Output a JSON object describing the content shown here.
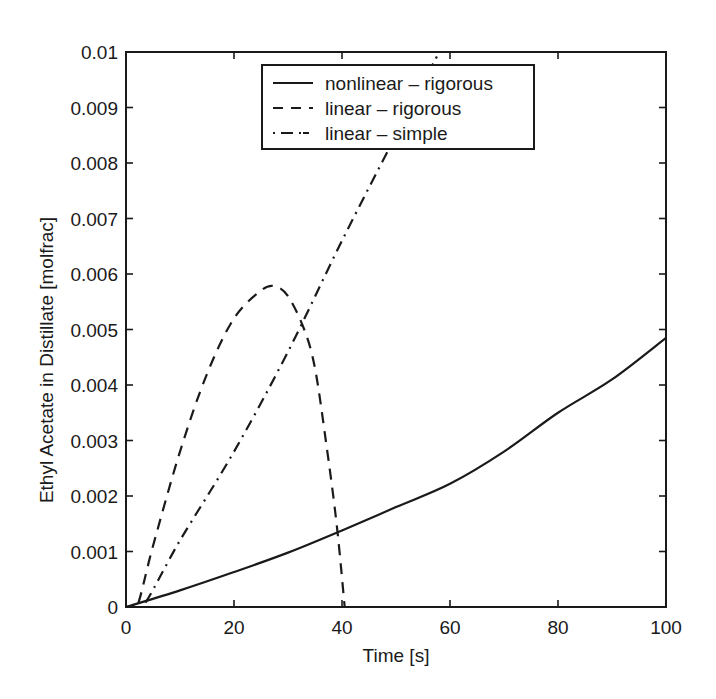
{
  "chart_data": {
    "type": "line",
    "title": "",
    "xlabel": "Time [s]",
    "ylabel": "Ethyl Acetate in Distillate [molfrac]",
    "xlim": [
      0,
      100
    ],
    "ylim": [
      0,
      0.01
    ],
    "grid": false,
    "legend_position": "upper center",
    "xticks": [
      0,
      20,
      40,
      60,
      80,
      100
    ],
    "xtick_labels": [
      "0",
      "20",
      "40",
      "60",
      "80",
      "100"
    ],
    "yticks": [
      0,
      0.001,
      0.002,
      0.003,
      0.004,
      0.005,
      0.006,
      0.007,
      0.008,
      0.009,
      0.01
    ],
    "ytick_labels": [
      "0",
      "0.001",
      "0.002",
      "0.003",
      "0.004",
      "0.005",
      "0.006",
      "0.007",
      "0.008",
      "0.009",
      "0.01"
    ],
    "series": [
      {
        "name": "nonlinear – rigorous",
        "style": "solid",
        "x": [
          0,
          10,
          20,
          30,
          40,
          50,
          60,
          70,
          80,
          90,
          100
        ],
        "y": [
          0,
          0.0003,
          0.00063,
          0.00098,
          0.00138,
          0.0018,
          0.00222,
          0.0028,
          0.0035,
          0.0041,
          0.00485
        ]
      },
      {
        "name": "linear – rigorous",
        "style": "dashed",
        "x": [
          0,
          2,
          5,
          10,
          15,
          20,
          25,
          27.5,
          30,
          33,
          35,
          37,
          39,
          40.5
        ],
        "y": [
          0,
          0,
          0.0011,
          0.0028,
          0.0042,
          0.0052,
          0.0057,
          0.00578,
          0.0056,
          0.005,
          0.0043,
          0.003,
          0.0015,
          0
        ]
      },
      {
        "name": "linear – simple",
        "style": "dashdot",
        "x": [
          0,
          3,
          10,
          20,
          30,
          40,
          50,
          58
        ],
        "y": [
          0,
          0,
          0.0012,
          0.0028,
          0.0046,
          0.0066,
          0.0085,
          0.01
        ]
      }
    ]
  },
  "legend": {
    "items": [
      {
        "label": "nonlinear – rigorous",
        "style": "solid"
      },
      {
        "label": "linear – rigorous",
        "style": "dashed"
      },
      {
        "label": "linear – simple",
        "style": "dashdot"
      }
    ]
  },
  "colors": {
    "ink": "#1a1a1a",
    "background": "#ffffff"
  }
}
